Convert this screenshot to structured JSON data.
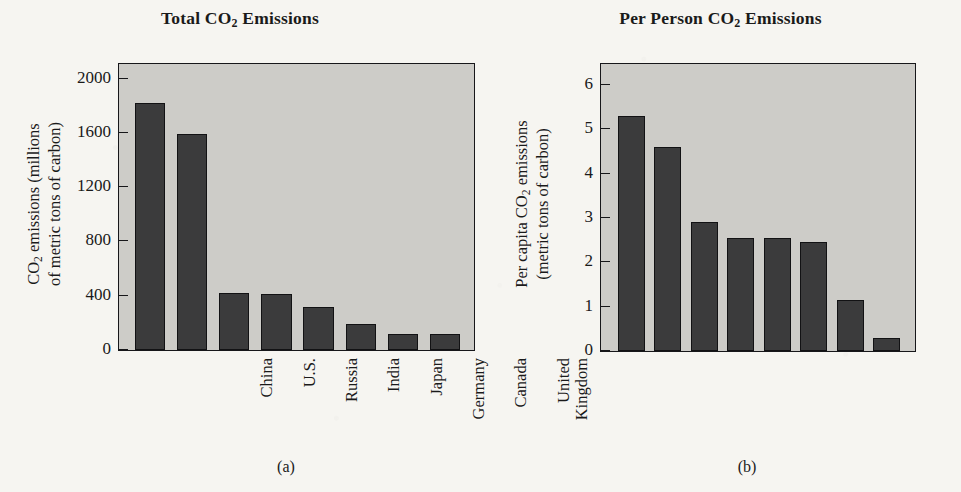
{
  "figure": {
    "panels": [
      {
        "key": "a",
        "subcaption": "(a)",
        "title_main": "Total CO",
        "title_sub": "2",
        "title_tail": " Emissions",
        "yaxis_line1": "CO",
        "yaxis_line1_sub": "2",
        "yaxis_line1_tail": " emissions (millions",
        "yaxis_line2": "of metric tons of carbon)"
      },
      {
        "key": "b",
        "subcaption": "(b)",
        "title_main": "Per Person CO",
        "title_sub": "2",
        "title_tail": " Emissions",
        "yaxis_line1": "Per capita CO",
        "yaxis_line1_sub": "2",
        "yaxis_line1_tail": " emissions",
        "yaxis_line2": "(metric tons of carbon)"
      }
    ]
  },
  "chart_data": [
    {
      "type": "bar",
      "panel": "a",
      "title": "Total CO2 Emissions",
      "xlabel": "",
      "ylabel": "CO2 emissions (millions of metric tons of carbon)",
      "ylim": [
        0,
        2100
      ],
      "yticks": [
        0,
        400,
        800,
        1200,
        1600,
        2000
      ],
      "ytick_labels": [
        "0",
        "400",
        "800",
        "1200",
        "1600",
        "2000"
      ],
      "grid": false,
      "legend": "none",
      "bar_color": "#3b3b3c",
      "plot_bg": "#cdccc8",
      "categories": [
        "China",
        "U.S.",
        "Russia",
        "India",
        "Japan",
        "Germany",
        "Canada",
        "United Kingdom"
      ],
      "category_lines": [
        [
          "China"
        ],
        [
          "U.S."
        ],
        [
          "Russia"
        ],
        [
          "India"
        ],
        [
          "Japan"
        ],
        [
          "Germany"
        ],
        [
          "Canada"
        ],
        [
          "United",
          "Kingdom"
        ]
      ],
      "values": [
        1820,
        1590,
        420,
        410,
        320,
        190,
        115,
        115
      ]
    },
    {
      "type": "bar",
      "panel": "b",
      "title": "Per Person CO2 Emissions",
      "xlabel": "",
      "ylabel": "Per capita CO2 emissions (metric tons of carbon)",
      "ylim": [
        0,
        6.45
      ],
      "yticks": [
        0,
        1,
        2,
        3,
        4,
        5,
        6
      ],
      "ytick_labels": [
        "0",
        "1",
        "2",
        "3",
        "4",
        "5",
        "6"
      ],
      "grid": false,
      "legend": "none",
      "bar_color": "#3b3b3c",
      "plot_bg": "#cdccc8",
      "categories": [
        "U.S.",
        "Canada",
        "Russia",
        "Germany",
        "Japan",
        "United Kingdom",
        "China",
        "India"
      ],
      "category_lines": [
        [
          "U.S."
        ],
        [
          "Canada"
        ],
        [
          "Russia"
        ],
        [
          "Germany"
        ],
        [
          "Japan"
        ],
        [
          "United",
          "Kingdom"
        ],
        [
          "China"
        ],
        [
          "India"
        ]
      ],
      "values": [
        5.3,
        4.6,
        2.9,
        2.55,
        2.55,
        2.45,
        1.15,
        0.3
      ]
    }
  ]
}
